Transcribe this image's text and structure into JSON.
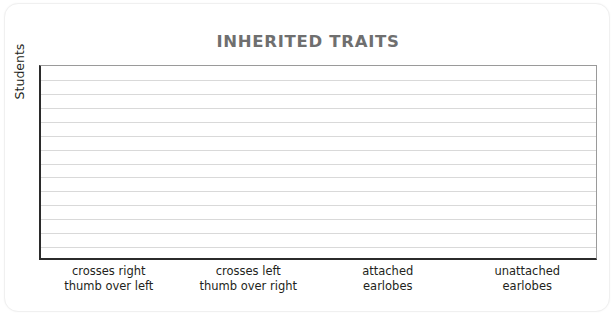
{
  "card": {
    "background_color": "#ffffff",
    "border_color": "#f0f0f0"
  },
  "chart_data": {
    "type": "bar",
    "title": "INHERITED TRAITS",
    "subtitle": "",
    "xlabel": "",
    "ylabel": "Students",
    "categories": [
      "crosses right thumb over left",
      "crosses left thumb over right",
      "attached earlobes",
      "unattached earlobes"
    ],
    "category_lines": [
      [
        "crosses right",
        "thumb over left"
      ],
      [
        "crosses left",
        "thumb over right"
      ],
      [
        "attached",
        "earlobes"
      ],
      [
        "unattached",
        "earlobes"
      ]
    ],
    "values": [
      0,
      0,
      0,
      0
    ],
    "ylim": [
      0,
      14
    ],
    "y_tick_labels": [],
    "gridlines": 13,
    "grid": true,
    "legend": false,
    "note": "empty grid — no bars plotted",
    "colors": {
      "title": "#6f6f6f",
      "axis": "#2b2b2b",
      "gridline": "#d9d9d9",
      "label": "#231f20",
      "bar": "#8d8d8d",
      "plot_background": "#ffffff"
    }
  }
}
